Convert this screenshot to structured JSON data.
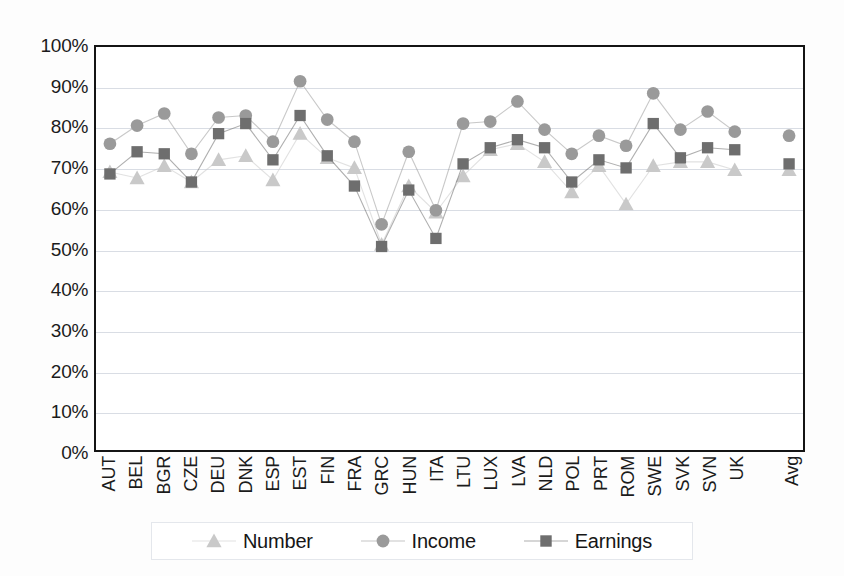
{
  "chart_data": {
    "type": "line",
    "title": "",
    "xlabel": "",
    "ylabel": "",
    "ylim": [
      0,
      100
    ],
    "ytick_labels": [
      "100%",
      "90%",
      "80%",
      "70%",
      "60%",
      "50%",
      "40%",
      "30%",
      "20%",
      "10%",
      "0%"
    ],
    "ytick_values": [
      100,
      90,
      80,
      70,
      60,
      50,
      40,
      30,
      20,
      10,
      0
    ],
    "grid": true,
    "legend_position": "bottom",
    "categories": [
      "AUT",
      "BEL",
      "BGR",
      "CZE",
      "DEU",
      "DNK",
      "ESP",
      "EST",
      "FIN",
      "FRA",
      "GRC",
      "HUN",
      "ITA",
      "LTU",
      "LUX",
      "LVA",
      "NLD",
      "POL",
      "PRT",
      "ROM",
      "SWE",
      "SVK",
      "SVN",
      "UK",
      "Avg"
    ],
    "series": [
      {
        "name": "Number",
        "marker": "triangle",
        "color": "#c9c9c9",
        "values": [
          69.0,
          67.5,
          70.5,
          66.5,
          72.0,
          73.0,
          67.0,
          78.5,
          72.5,
          70.0,
          51.0,
          65.5,
          59.0,
          68.0,
          74.5,
          76.0,
          71.5,
          64.0,
          70.5,
          61.0,
          70.5,
          71.5,
          71.5,
          69.5,
          69.5
        ]
      },
      {
        "name": "Income",
        "marker": "circle",
        "color": "#9a9a9a",
        "values": [
          76.0,
          80.5,
          83.5,
          73.5,
          82.5,
          83.0,
          76.5,
          91.5,
          82.0,
          76.5,
          56.0,
          74.0,
          59.5,
          81.0,
          81.5,
          86.5,
          79.5,
          73.5,
          78.0,
          75.5,
          88.5,
          79.5,
          84.0,
          79.0,
          78.0
        ]
      },
      {
        "name": "Earnings",
        "marker": "square",
        "color": "#6e6e6e",
        "values": [
          68.5,
          74.0,
          73.5,
          66.5,
          78.5,
          81.0,
          72.0,
          83.0,
          73.0,
          65.5,
          50.5,
          64.5,
          52.5,
          71.0,
          75.0,
          77.0,
          75.0,
          66.5,
          72.0,
          70.0,
          81.0,
          72.5,
          75.0,
          74.5,
          71.0
        ]
      }
    ]
  },
  "legend": {
    "entries": [
      {
        "label": "Number"
      },
      {
        "label": "Income"
      },
      {
        "label": "Earnings"
      }
    ]
  }
}
